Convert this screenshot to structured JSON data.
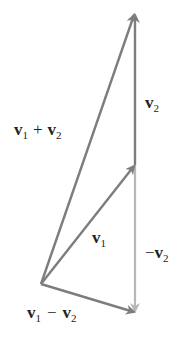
{
  "diagram": {
    "colors": {
      "dark_arrow": "#7d7d7d",
      "light_arrow": "#b8b8b8",
      "text": "#222222",
      "background": "#ffffff"
    },
    "points": {
      "origin": [
        41,
        284
      ],
      "v1_tip": [
        135,
        165
      ],
      "sum_tip": [
        135,
        14
      ],
      "diff_tip": [
        135,
        312
      ]
    },
    "labels": {
      "v2": {
        "base": "v",
        "sub": "2"
      },
      "sum": {
        "a": "v",
        "a_sub": "1",
        "op": "+",
        "b": "v",
        "b_sub": "2"
      },
      "v1": {
        "base": "v",
        "sub": "1"
      },
      "neg_v2": {
        "sign": "−",
        "base": "v",
        "sub": "2"
      },
      "diff": {
        "a": "v",
        "a_sub": "1",
        "op": "−",
        "b": "v",
        "b_sub": "2"
      }
    }
  }
}
